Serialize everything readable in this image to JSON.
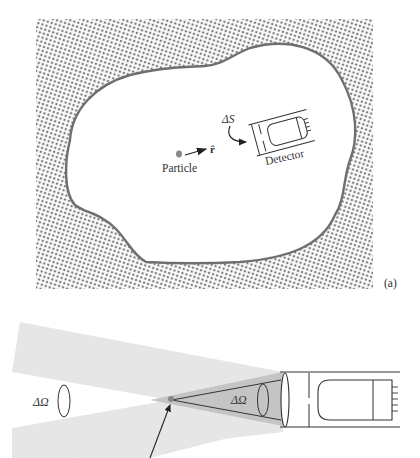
{
  "figure_a": {
    "panel_label": "(a)",
    "particle_label": "Particle",
    "unit_vector_label": "r̂",
    "surface_element_label": "ΔS",
    "detector_label": "Detector"
  },
  "figure_b": {
    "solid_angle_left_label": "ΔΩ",
    "solid_angle_right_label": "ΔΩ"
  },
  "colors": {
    "pattern_dot": "#7a7a7a",
    "boundary": "#6f6f6f",
    "beam_light": "#e6e6e6",
    "beam_dark": "#c4c4c4",
    "particle": "#888888",
    "line": "#333333"
  }
}
